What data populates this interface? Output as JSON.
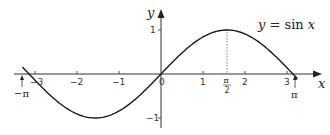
{
  "chart_data": {
    "type": "line",
    "title": "",
    "series": [
      {
        "name": "y = sin x",
        "function": "sin(x)",
        "x_range": [
          -3.14159,
          3.14159
        ]
      }
    ],
    "xlabel": "x",
    "ylabel": "y",
    "xlim": [
      -3.3,
      3.5
    ],
    "ylim": [
      -1.2,
      1.3
    ],
    "x_ticks": [
      "-3",
      "-2",
      "-1",
      "0",
      "1",
      "2",
      "3"
    ],
    "y_ticks": [
      "1",
      "-1"
    ],
    "annotations": [
      {
        "text": "y = sin x",
        "position": "upper right of curve"
      },
      {
        "text": "-π",
        "x": -3.14159,
        "arrow": true
      },
      {
        "text": "π",
        "x": 3.14159,
        "arrow": true
      },
      {
        "text": "π/2",
        "x": 1.5708,
        "dotted_line_to_max": true
      }
    ],
    "grid": false
  },
  "labels": {
    "x_axis": "x",
    "y_axis": "y",
    "equation_y": "y",
    "equation_rest": " = sin ",
    "equation_x": "x",
    "neg_pi": "−π",
    "pi": "π",
    "half_pi_num": "π",
    "half_pi_den": "2",
    "origin": "0",
    "tick_neg3": "−3",
    "tick_neg2": "−2",
    "tick_neg1": "−1",
    "tick_1": "1",
    "tick_2": "2",
    "tick_3": "3",
    "ytick_1": "1",
    "ytick_neg1": "−1"
  }
}
